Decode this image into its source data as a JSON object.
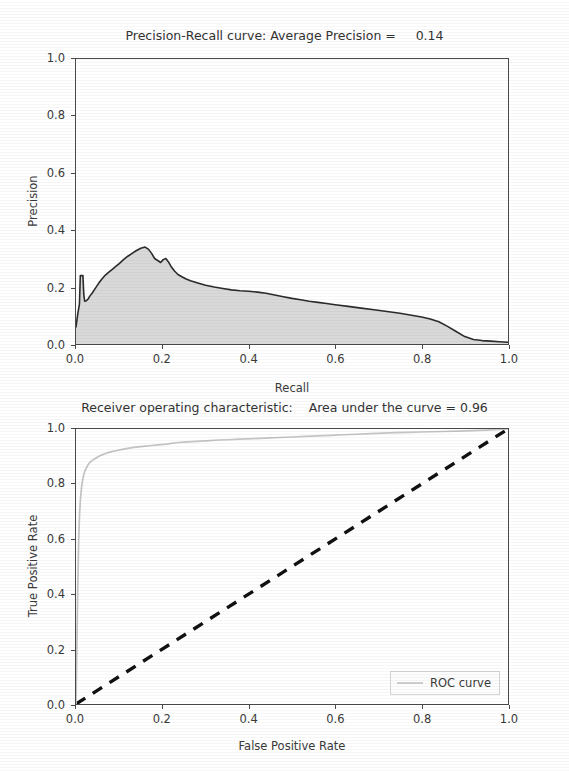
{
  "figure": {
    "background": "#ffffff",
    "text_color": "#3a3a3a"
  },
  "chart_data": [
    {
      "id": "precision-recall",
      "type": "line",
      "title": "Precision-Recall curve: Average Precision =     0.14",
      "title_prefix": "Precision-Recall curve: Average Precision =",
      "average_precision": 0.14,
      "xlabel": "Recall",
      "ylabel": "Precision",
      "xlim": [
        0.0,
        1.0
      ],
      "ylim": [
        0.0,
        1.0
      ],
      "xticks": [
        "0.0",
        "0.2",
        "0.4",
        "0.6",
        "0.8",
        "1.0"
      ],
      "xtick_values": [
        0.0,
        0.2,
        0.4,
        0.6,
        0.8,
        1.0
      ],
      "yticks": [
        "0.0",
        "0.2",
        "0.4",
        "0.6",
        "0.8",
        "1.0"
      ],
      "ytick_values": [
        0.0,
        0.2,
        0.4,
        0.6,
        0.8,
        1.0
      ],
      "grid": false,
      "legend": null,
      "fill": true,
      "fill_color": "#d9d9d9",
      "line_color": "#2b2b2b",
      "x": [
        0.0,
        0.004,
        0.008,
        0.01,
        0.012,
        0.014,
        0.016,
        0.018,
        0.02,
        0.024,
        0.028,
        0.032,
        0.038,
        0.045,
        0.052,
        0.06,
        0.068,
        0.076,
        0.084,
        0.092,
        0.1,
        0.11,
        0.12,
        0.13,
        0.14,
        0.15,
        0.16,
        0.168,
        0.175,
        0.182,
        0.19,
        0.196,
        0.202,
        0.208,
        0.214,
        0.22,
        0.228,
        0.236,
        0.245,
        0.255,
        0.265,
        0.28,
        0.3,
        0.32,
        0.34,
        0.36,
        0.38,
        0.4,
        0.42,
        0.44,
        0.46,
        0.48,
        0.5,
        0.52,
        0.54,
        0.56,
        0.58,
        0.6,
        0.63,
        0.66,
        0.69,
        0.72,
        0.75,
        0.78,
        0.8,
        0.82,
        0.84,
        0.86,
        0.88,
        0.9,
        0.92,
        0.94,
        0.96,
        0.98,
        1.0
      ],
      "y": [
        0.06,
        0.105,
        0.14,
        0.24,
        0.24,
        0.24,
        0.24,
        0.175,
        0.15,
        0.152,
        0.158,
        0.168,
        0.18,
        0.196,
        0.212,
        0.228,
        0.242,
        0.252,
        0.262,
        0.272,
        0.282,
        0.296,
        0.308,
        0.318,
        0.328,
        0.336,
        0.34,
        0.332,
        0.318,
        0.3,
        0.292,
        0.286,
        0.296,
        0.3,
        0.288,
        0.272,
        0.256,
        0.244,
        0.236,
        0.228,
        0.222,
        0.215,
        0.206,
        0.2,
        0.195,
        0.19,
        0.187,
        0.185,
        0.182,
        0.178,
        0.172,
        0.166,
        0.16,
        0.155,
        0.15,
        0.146,
        0.142,
        0.138,
        0.132,
        0.126,
        0.12,
        0.114,
        0.108,
        0.1,
        0.095,
        0.088,
        0.078,
        0.062,
        0.044,
        0.026,
        0.016,
        0.012,
        0.01,
        0.008,
        0.006
      ]
    },
    {
      "id": "roc",
      "type": "line",
      "title": "Receiver operating characteristic:    Area under the curve = 0.96",
      "title_prefix": "Receiver operating characteristic:",
      "auc": 0.96,
      "xlabel": "False Positive Rate",
      "ylabel": "True Positive Rate",
      "xlim": [
        0.0,
        1.0
      ],
      "ylim": [
        0.0,
        1.0
      ],
      "xticks": [
        "0.0",
        "0.2",
        "0.4",
        "0.6",
        "0.8",
        "1.0"
      ],
      "xtick_values": [
        0.0,
        0.2,
        0.4,
        0.6,
        0.8,
        1.0
      ],
      "yticks": [
        "0.0",
        "0.2",
        "0.4",
        "0.6",
        "0.8",
        "1.0"
      ],
      "ytick_values": [
        0.0,
        0.2,
        0.4,
        0.6,
        0.8,
        1.0
      ],
      "grid": false,
      "legend": {
        "position": "lower right",
        "entries": [
          {
            "label": "ROC curve",
            "color": "#cfcfcf",
            "style": "solid"
          }
        ]
      },
      "series": [
        {
          "name": "ROC curve",
          "color": "#c4c4c4",
          "style": "solid",
          "x": [
            0.0,
            0.002,
            0.004,
            0.006,
            0.008,
            0.01,
            0.013,
            0.016,
            0.02,
            0.025,
            0.03,
            0.036,
            0.042,
            0.05,
            0.06,
            0.07,
            0.08,
            0.095,
            0.11,
            0.13,
            0.15,
            0.17,
            0.19,
            0.21,
            0.23,
            0.25,
            0.27,
            0.29,
            0.31,
            0.33,
            0.35,
            0.38,
            0.41,
            0.44,
            0.47,
            0.5,
            0.53,
            0.56,
            0.59,
            0.62,
            0.65,
            0.68,
            0.71,
            0.74,
            0.77,
            0.8,
            0.85,
            0.9,
            0.95,
            1.0
          ],
          "y": [
            0.0,
            0.2,
            0.42,
            0.58,
            0.68,
            0.74,
            0.79,
            0.82,
            0.845,
            0.862,
            0.875,
            0.884,
            0.89,
            0.898,
            0.906,
            0.912,
            0.917,
            0.922,
            0.927,
            0.932,
            0.936,
            0.939,
            0.942,
            0.945,
            0.95,
            0.952,
            0.954,
            0.956,
            0.958,
            0.96,
            0.961,
            0.963,
            0.965,
            0.967,
            0.969,
            0.971,
            0.973,
            0.975,
            0.977,
            0.979,
            0.981,
            0.983,
            0.985,
            0.987,
            0.988,
            0.989,
            0.991,
            0.993,
            0.996,
            1.0
          ]
        },
        {
          "name": "chance-diagonal",
          "color": "#111111",
          "style": "dashed",
          "x": [
            0.0,
            1.0
          ],
          "y": [
            0.0,
            1.0
          ]
        }
      ]
    }
  ]
}
